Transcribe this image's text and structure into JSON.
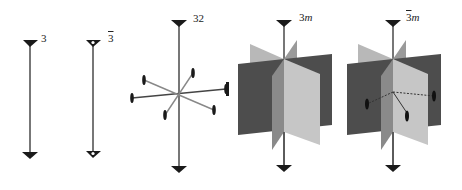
{
  "figure": {
    "colors": {
      "background": "#ffffff",
      "axis": "#555555",
      "triangle": "#1a1a1a",
      "plane_dark": "#4a4a4a",
      "plane_mid": "#8c8c8c",
      "plane_light": "#c8c8c8",
      "twofold_marker": "#1a1a1a"
    },
    "panels": [
      {
        "id": "3",
        "label_main": "3",
        "label_bar": "",
        "label_suffix": "",
        "type": "threefold-axis"
      },
      {
        "id": "3bar",
        "label_main": "",
        "label_bar": "3",
        "label_suffix": "",
        "type": "threefold-rotoinversion-axis"
      },
      {
        "id": "32",
        "label_main": "32",
        "label_bar": "",
        "label_suffix": "",
        "type": "threefold-axis-with-three-twofold-axes"
      },
      {
        "id": "3m",
        "label_main": "3",
        "label_bar": "",
        "label_suffix": "m",
        "type": "threefold-axis-with-three-mirror-planes"
      },
      {
        "id": "3barm",
        "label_main": "",
        "label_bar": "3",
        "label_suffix": "m",
        "type": "threefold-rotoinversion-axis-with-mirror-planes-and-twofold-axes"
      }
    ]
  }
}
